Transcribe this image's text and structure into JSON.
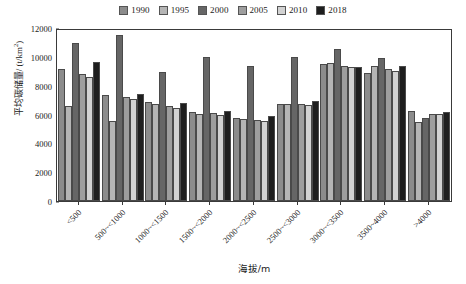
{
  "chart_data": {
    "type": "bar",
    "title": "",
    "xlabel": "海拔/m",
    "ylabel": "平均碳储量/ (t/km²)",
    "ylim": [
      0,
      12000
    ],
    "ytick_values": [
      0,
      2000,
      4000,
      6000,
      8000,
      10000,
      12000
    ],
    "ytick_labels": [
      "0",
      "2000",
      "4000",
      "6000",
      "8000",
      "10000",
      "12000"
    ],
    "grid": false,
    "legend_position": "top-center",
    "categories": [
      "<500",
      "500~<1000",
      "1000~<1500",
      "1500~<2000",
      "2000~<2500",
      "2500~<3000",
      "3000~<3500",
      "3500~4000",
      ">4000"
    ],
    "series": [
      {
        "name": "1990",
        "color": "#8c8c8c",
        "values": [
          9180,
          7330,
          6880,
          6170,
          5730,
          6700,
          9520,
          8880,
          6210
        ]
      },
      {
        "name": "1995",
        "color": "#b5b5b5",
        "values": [
          6580,
          5530,
          6760,
          6020,
          5700,
          6710,
          9600,
          9390,
          5490
        ]
      },
      {
        "name": "2000",
        "color": "#666666",
        "values": [
          10960,
          11520,
          8940,
          9960,
          9370,
          9980,
          10560,
          9930,
          5740
        ]
      },
      {
        "name": "2005",
        "color": "#9e9e9e",
        "values": [
          8790,
          7200,
          6570,
          6080,
          5600,
          6760,
          9340,
          9180,
          6060
        ]
      },
      {
        "name": "2010",
        "color": "#d2d2d2",
        "values": [
          8620,
          7060,
          6470,
          5980,
          5540,
          6640,
          9310,
          9040,
          6040
        ]
      },
      {
        "name": "2018",
        "color": "#1e1e1e",
        "values": [
          9640,
          7410,
          6810,
          6260,
          5900,
          6930,
          9270,
          9360,
          6200
        ]
      }
    ]
  }
}
